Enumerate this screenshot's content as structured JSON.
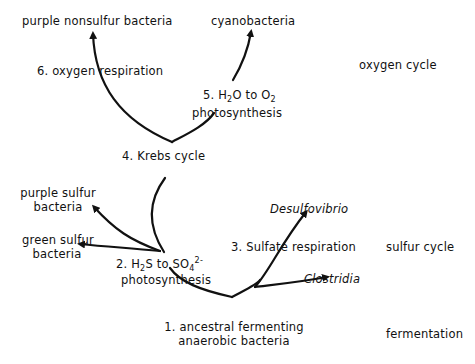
{
  "diagram": {
    "type": "evolutionary-tree",
    "nodes": {
      "purple_nonsulfur": "purple nonsulfur bacteria",
      "cyanobacteria": "cyanobacteria",
      "oxygen_respiration": "6. oxygen respiration",
      "h2o_o2": {
        "prefix": "5. H",
        "sub1": "2",
        "mid": "O  to O",
        "sub2": "2",
        "line2": "photosynthesis"
      },
      "krebs": "4. Krebs  cycle",
      "purple_sulfur": {
        "line1": "purple sulfur",
        "line2": "bacteria"
      },
      "green_sulfur": {
        "line1": "green sulfur",
        "line2": "bacteria"
      },
      "h2s_so4": {
        "prefix": "2. H",
        "sub1": "2",
        "mid": "S  to SO",
        "sub2": "4",
        "sup": "2-",
        "line2": "photosynthesis"
      },
      "desulfovibrio": "Desulfovibrio",
      "sulfate_respiration": "3. Sulfate respiration",
      "clostridia": "Clostridia",
      "ancestral": {
        "line1": "1. ancestral  fermenting",
        "line2": "anaerobic  bacteria"
      }
    },
    "cycles": {
      "oxygen": "oxygen cycle",
      "sulfur": "sulfur cycle",
      "fermentation": "fermentation"
    }
  }
}
